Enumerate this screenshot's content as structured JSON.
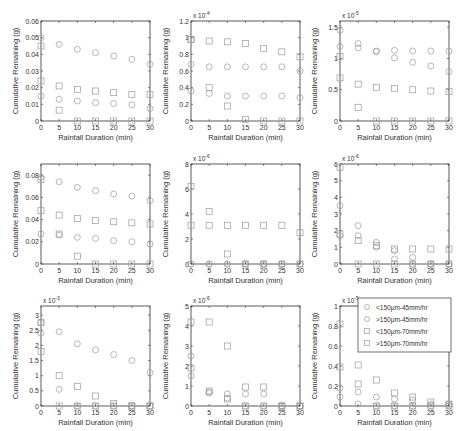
{
  "figure": {
    "xlabel": "Rainfall Duration (min)",
    "ylabel": "Cumulative Remaining (g)",
    "marker_color": "#9a9a9a",
    "axis_color": "#333333"
  },
  "legend": {
    "entries": [
      {
        "label": "<150μm-45mm/hr",
        "marker": "circle"
      },
      {
        "label": ">150μm-45mm/hr",
        "marker": "circle"
      },
      {
        "label": "<150μm-70mm/hr",
        "marker": "square"
      },
      {
        "label": ">150μm-70mm/hr",
        "marker": "square"
      }
    ]
  },
  "chart_data": [
    {
      "type": "scatter",
      "panel": "row1-col1",
      "xlabel": "Rainfall Duration (min)",
      "ylabel": "Cumulative Remaining (g)",
      "x": [
        0,
        5,
        10,
        15,
        20,
        25,
        30
      ],
      "xlim": [
        0,
        30
      ],
      "xticks": [
        "0",
        "5",
        "10",
        "15",
        "20",
        "25",
        "30"
      ],
      "ylim": [
        0,
        0.06
      ],
      "yticks": [
        "0",
        "0.01",
        "0.02",
        "0.03",
        "0.04",
        "0.05",
        "0.06"
      ],
      "yticks_val": [
        0,
        0.01,
        0.02,
        0.03,
        0.04,
        0.05,
        0.06
      ],
      "exponent": "",
      "series": [
        {
          "name": "<150μm-45mm/hr",
          "marker": "circle",
          "values": [
            0.05,
            0.046,
            0.043,
            0.041,
            0.039,
            0.037,
            0.034
          ]
        },
        {
          "name": ">150μm-45mm/hr",
          "marker": "circle",
          "values": [
            0.015,
            0.013,
            0.012,
            0.011,
            0.0105,
            0.0097,
            0.0075
          ]
        },
        {
          "name": "<150μm-70mm/hr",
          "marker": "square",
          "values": [
            0.045,
            0.021,
            0.019,
            0.018,
            0.017,
            0.016,
            0.016
          ]
        },
        {
          "name": ">150μm-70mm/hr",
          "marker": "square",
          "values": [
            0.024,
            0.0065,
            0,
            0,
            0,
            0,
            0
          ]
        }
      ]
    },
    {
      "type": "scatter",
      "panel": "row1-col2",
      "xlabel": "Rainfall Duration (min)",
      "ylabel": "Cumulative Remaining (g)",
      "x": [
        0,
        5,
        10,
        15,
        20,
        25,
        30
      ],
      "xlim": [
        0,
        30
      ],
      "xticks": [
        "0",
        "5",
        "10",
        "15",
        "20",
        "25",
        "30"
      ],
      "ylim": [
        0,
        1.2
      ],
      "yticks": [
        "0",
        "0.2",
        "0.4",
        "0.6",
        "0.8",
        "1",
        "1.2"
      ],
      "yticks_val": [
        0,
        0.2,
        0.4,
        0.6,
        0.8,
        1,
        1.2
      ],
      "exponent": "x 10-4",
      "series": [
        {
          "name": "<150μm-45mm/hr",
          "marker": "circle",
          "values": [
            0.68,
            0.65,
            0.65,
            0.65,
            0.65,
            0.65,
            0.6
          ]
        },
        {
          "name": ">150μm-45mm/hr",
          "marker": "circle",
          "values": [
            0.36,
            0.33,
            0.3,
            0.3,
            0.3,
            0.3,
            0.28
          ]
        },
        {
          "name": "<150μm-70mm/hr",
          "marker": "square",
          "values": [
            0.98,
            0.96,
            0.95,
            0.93,
            0.87,
            0.83,
            0.77
          ]
        },
        {
          "name": ">150μm-70mm/hr",
          "marker": "square",
          "values": [
            0.98,
            0.4,
            0.18,
            0.02,
            0,
            0,
            0
          ]
        }
      ]
    },
    {
      "type": "scatter",
      "panel": "row1-col3",
      "xlabel": "Rainfall Duration (min)",
      "ylabel": "Cumulative Remaining (g)",
      "x": [
        0,
        5,
        10,
        15,
        20,
        25,
        30
      ],
      "xlim": [
        0,
        30
      ],
      "xticks": [
        "0",
        "5",
        "10",
        "15",
        "20",
        "25",
        "30"
      ],
      "ylim": [
        0,
        1.6
      ],
      "yticks": [
        "0",
        "0.5",
        "1",
        "1.5"
      ],
      "yticks_val": [
        0,
        0.5,
        1,
        1.5
      ],
      "exponent": "x 10-5",
      "series": [
        {
          "name": "<150μm-45mm/hr",
          "marker": "circle",
          "values": [
            1.45,
            1.24,
            1.12,
            1.13,
            1.12,
            1.12,
            1.12
          ]
        },
        {
          "name": ">150μm-45mm/hr",
          "marker": "circle",
          "values": [
            1.19,
            1.17,
            1.11,
            1.01,
            0.94,
            0.88,
            0.79
          ]
        },
        {
          "name": "<150μm-70mm/hr",
          "marker": "square",
          "values": [
            1.03,
            0.59,
            0.54,
            0.52,
            0.5,
            0.48,
            0.47
          ]
        },
        {
          "name": ">150μm-70mm/hr",
          "marker": "square",
          "values": [
            0.69,
            0.22,
            0,
            0,
            0,
            0,
            0
          ]
        }
      ]
    },
    {
      "type": "scatter",
      "panel": "row2-col1",
      "xlabel": "Rainfall Duration (min)",
      "ylabel": "Cumulative Remaining (g)",
      "x": [
        0,
        5,
        10,
        15,
        20,
        25,
        30
      ],
      "xlim": [
        0,
        30
      ],
      "xticks": [
        "0",
        "5",
        "10",
        "15",
        "20",
        "25",
        "30"
      ],
      "ylim": [
        0,
        0.09
      ],
      "yticks": [
        "0",
        "0.02",
        "0.04",
        "0.06",
        "0.08"
      ],
      "yticks_val": [
        0,
        0.02,
        0.04,
        0.06,
        0.08
      ],
      "exponent": "",
      "series": [
        {
          "name": "<150μm-45mm/hr",
          "marker": "circle",
          "values": [
            0.078,
            0.074,
            0.069,
            0.066,
            0.063,
            0.061,
            0.057
          ]
        },
        {
          "name": ">150μm-45mm/hr",
          "marker": "circle",
          "values": [
            0.027,
            0.026,
            0.024,
            0.023,
            0.021,
            0.02,
            0.018
          ]
        },
        {
          "name": "<150μm-70mm/hr",
          "marker": "square",
          "values": [
            0.076,
            0.044,
            0.041,
            0.039,
            0.038,
            0.037,
            0.036
          ]
        },
        {
          "name": ">150μm-70mm/hr",
          "marker": "square",
          "values": [
            0.048,
            0.027,
            0.007,
            0,
            0,
            0,
            0
          ]
        }
      ]
    },
    {
      "type": "scatter",
      "panel": "row2-col2",
      "xlabel": "Rainfall Duration (min)",
      "ylabel": "Cumulative Remaining (g)",
      "x": [
        0,
        5,
        10,
        15,
        20,
        25,
        30
      ],
      "xlim": [
        0,
        30
      ],
      "xticks": [
        "0",
        "5",
        "10",
        "15",
        "20",
        "25",
        "30"
      ],
      "ylim": [
        0,
        8
      ],
      "yticks": [
        "0",
        "2",
        "4",
        "6",
        "8"
      ],
      "yticks_val": [
        0,
        2,
        4,
        6,
        8
      ],
      "exponent": "x 10-6",
      "series": [
        {
          "name": "<150μm-45mm/hr",
          "marker": "circle",
          "values": [
            0,
            0,
            0,
            0,
            0,
            0,
            0
          ]
        },
        {
          "name": ">150μm-45mm/hr",
          "marker": "circle",
          "values": [
            0,
            0,
            0,
            0,
            0,
            0,
            0
          ]
        },
        {
          "name": "<150μm-70mm/hr",
          "marker": "square",
          "values": [
            6.2,
            4.2,
            3.1,
            3.1,
            3.1,
            3.1,
            2.5
          ]
        },
        {
          "name": ">150μm-70mm/hr",
          "marker": "square",
          "values": [
            3.1,
            3.1,
            0.8,
            0,
            0,
            0,
            0
          ]
        }
      ]
    },
    {
      "type": "scatter",
      "panel": "row2-col3",
      "xlabel": "Rainfall Duration (min)",
      "ylabel": "Cumulative Remaining (g)",
      "x": [
        0,
        5,
        10,
        15,
        20,
        25,
        30
      ],
      "xlim": [
        0,
        30
      ],
      "xticks": [
        "0",
        "5",
        "10",
        "15",
        "20",
        "25",
        "30"
      ],
      "ylim": [
        0,
        6
      ],
      "yticks": [
        "0",
        "1",
        "2",
        "3",
        "4",
        "5",
        "6"
      ],
      "yticks_val": [
        0,
        1,
        2,
        3,
        4,
        5,
        6
      ],
      "exponent": "x 10-6",
      "series": [
        {
          "name": "<150μm-45mm/hr",
          "marker": "circle",
          "values": [
            3.5,
            2.3,
            1.3,
            0.8,
            0.4,
            0,
            0
          ]
        },
        {
          "name": ">150μm-45mm/hr",
          "marker": "circle",
          "values": [
            1.7,
            1.7,
            1.0,
            0.3,
            0,
            0,
            0
          ]
        },
        {
          "name": "<150μm-70mm/hr",
          "marker": "square",
          "values": [
            5.8,
            1.4,
            1.1,
            0.9,
            0.9,
            0.9,
            0.9
          ]
        },
        {
          "name": ">150μm-70mm/hr",
          "marker": "square",
          "values": [
            1.8,
            0,
            0,
            0,
            0,
            0,
            0
          ]
        }
      ]
    },
    {
      "type": "scatter",
      "panel": "row3-col1",
      "xlabel": "Rainfall Duration (min)",
      "ylabel": "Cumulative Remaining (g)",
      "x": [
        0,
        5,
        10,
        15,
        20,
        25,
        30
      ],
      "xlim": [
        0,
        30
      ],
      "xticks": [
        "0",
        "5",
        "10",
        "15",
        "20",
        "25",
        "30"
      ],
      "ylim": [
        0,
        3.3
      ],
      "yticks": [
        "0",
        "0.5",
        "1",
        "1.5",
        "2",
        "2.5",
        "3"
      ],
      "yticks_val": [
        0,
        0.5,
        1,
        1.5,
        2,
        2.5,
        3
      ],
      "exponent": "x 10-3",
      "series": [
        {
          "name": "<150μm-45mm/hr",
          "marker": "circle",
          "values": [
            2.75,
            2.45,
            2.05,
            1.85,
            1.7,
            1.5,
            1.1
          ]
        },
        {
          "name": ">150μm-45mm/hr",
          "marker": "circle",
          "values": [
            2.4,
            0.55,
            0,
            0,
            0,
            0,
            0
          ]
        },
        {
          "name": "<150μm-70mm/hr",
          "marker": "square",
          "values": [
            2.75,
            1.0,
            0.65,
            0.33,
            0.08,
            0,
            0
          ]
        },
        {
          "name": ">150μm-70mm/hr",
          "marker": "square",
          "values": [
            1.8,
            0,
            0,
            0,
            0,
            0,
            0
          ]
        }
      ]
    },
    {
      "type": "scatter",
      "panel": "row3-col2",
      "xlabel": "Rainfall Duration (min)",
      "ylabel": "Cumulative Remaining (g)",
      "x": [
        0,
        5,
        10,
        15,
        20,
        25,
        30
      ],
      "xlim": [
        0,
        30
      ],
      "xticks": [
        "0",
        "5",
        "10",
        "15",
        "20",
        "25",
        "30"
      ],
      "ylim": [
        0,
        5
      ],
      "yticks": [
        "0",
        "1",
        "2",
        "3",
        "4",
        "5"
      ],
      "yticks_val": [
        0,
        1,
        2,
        3,
        4,
        5
      ],
      "exponent": "x 10-6",
      "series": [
        {
          "name": "<150μm-45mm/hr",
          "marker": "circle",
          "values": [
            2.5,
            0.7,
            0.6,
            0.6,
            0.6,
            0,
            0
          ]
        },
        {
          "name": ">150μm-45mm/hr",
          "marker": "circle",
          "values": [
            1.5,
            0.65,
            0.4,
            0,
            0,
            0,
            0
          ]
        },
        {
          "name": "<150μm-70mm/hr",
          "marker": "square",
          "values": [
            4.2,
            4.2,
            3.0,
            0.95,
            0.95,
            0,
            0
          ]
        },
        {
          "name": ">150μm-70mm/hr",
          "marker": "square",
          "values": [
            1.9,
            0.75,
            0.35,
            0,
            0,
            0,
            0
          ]
        }
      ]
    },
    {
      "type": "scatter",
      "panel": "row3-col3",
      "xlabel": "Rainfall Duration (min)",
      "ylabel": "Cumulative Remaining (g)",
      "x": [
        0,
        5,
        10,
        15,
        20,
        25,
        30
      ],
      "xlim": [
        0,
        30
      ],
      "xticks": [
        "0",
        "5",
        "10",
        "15",
        "20",
        "25",
        "30"
      ],
      "ylim": [
        0,
        1
      ],
      "yticks": [
        "0",
        "0.2",
        "0.4",
        "0.6",
        "0.8",
        "1"
      ],
      "yticks_val": [
        0,
        0.2,
        0.4,
        0.6,
        0.8,
        1
      ],
      "exponent": "x 10-5",
      "series": [
        {
          "name": "<150μm-45mm/hr",
          "marker": "circle",
          "values": [
            0.18,
            0.14,
            0.09,
            0.07,
            0.06,
            0.02,
            0.02
          ]
        },
        {
          "name": ">150μm-45mm/hr",
          "marker": "circle",
          "values": [
            0.09,
            0.02,
            0,
            0,
            0,
            0,
            0
          ]
        },
        {
          "name": "<150μm-70mm/hr",
          "marker": "square",
          "values": [
            0.82,
            0.41,
            0.26,
            0.13,
            0.09,
            0.04,
            0.02
          ]
        },
        {
          "name": ">150μm-70mm/hr",
          "marker": "square",
          "values": [
            0.39,
            0.22,
            0,
            0,
            0,
            0,
            0
          ]
        }
      ],
      "legend": true
    }
  ]
}
